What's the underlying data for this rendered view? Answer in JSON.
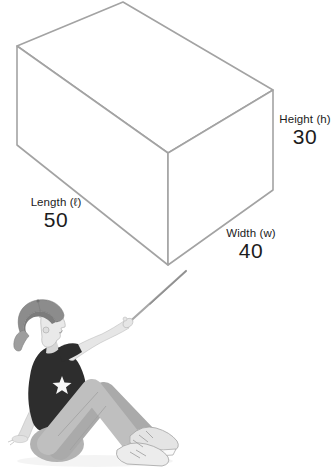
{
  "page": {
    "background": "#ffffff",
    "text_color": "#1c1c1c"
  },
  "diagram": {
    "type": "rectangular-prism",
    "edge_color": "#a3a3a3",
    "height": {
      "label": "Height (h)",
      "value": "30"
    },
    "length": {
      "label": "Length (ℓ)",
      "value": "50"
    },
    "width": {
      "label": "Width (w)",
      "value": "40"
    }
  },
  "illustration": {
    "name": "child-pointing-with-stick"
  }
}
